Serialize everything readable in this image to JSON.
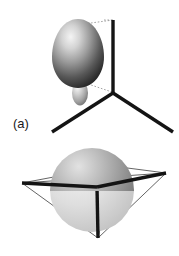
{
  "figure": {
    "background_color": "#ffffff",
    "width": 179,
    "height": 256
  },
  "panels": [
    {
      "id": "a",
      "label": "(a)",
      "label_position": {
        "x": 13,
        "y": 117
      },
      "axes": {
        "name": "three-bond-axis-frame",
        "vertex": {
          "x": 113,
          "y": 93
        },
        "color": "#141414",
        "stroke_width": 3.4,
        "arms": [
          {
            "name": "axis-up",
            "x2": 113,
            "y2": 20
          },
          {
            "name": "axis-lower-left",
            "x2": 52,
            "y2": 131
          },
          {
            "name": "axis-lower-right",
            "x2": 172,
            "y2": 131
          }
        ]
      },
      "orbital": {
        "name": "major-lobe",
        "shape": "teardrop",
        "center": {
          "x": 78,
          "y": 55
        },
        "rx": 26,
        "ry": 36,
        "fill_light": "#efefef",
        "fill_mid": "#8d8d8d",
        "fill_dark": "#2d2d2d",
        "highlight": {
          "x": 66,
          "y": 42
        }
      },
      "minor_orbital": {
        "name": "minor-lobe",
        "shape": "ellipse",
        "center": {
          "x": 80,
          "y": 93
        },
        "rx": 8,
        "ry": 12,
        "fill_light": "#f2f2f2",
        "fill_mid": "#a8a8a8",
        "fill_dark": "#616161"
      },
      "guides": {
        "name": "dotted-projection-lines",
        "color": "#9a9a9a",
        "stroke_width": 0.9,
        "dash": "1.6 1.8",
        "lines": [
          {
            "x1": 92,
            "y1": 22,
            "x2": 113,
            "y2": 20
          },
          {
            "x1": 87,
            "y1": 84,
            "x2": 113,
            "y2": 93
          }
        ]
      }
    },
    {
      "id": "b",
      "label": "(b)",
      "label_position": {
        "x": 13,
        "y": 222
      },
      "axes": {
        "name": "three-bond-axis-frame",
        "vertex": {
          "x": 97,
          "y": 187
        },
        "color": "#141414",
        "stroke_width": 3.4,
        "arms": [
          {
            "name": "axis-left",
            "x2": 22,
            "y2": 183
          },
          {
            "name": "axis-right",
            "x2": 166,
            "y2": 173
          },
          {
            "name": "axis-down",
            "x2": 98,
            "y2": 238
          }
        ]
      },
      "frame": {
        "name": "thin-tetrahedron-outline",
        "color": "#3c3c3c",
        "stroke_width": 0.8,
        "vertices": [
          {
            "name": "vertex-left",
            "x": 22,
            "y": 183
          },
          {
            "name": "vertex-right",
            "x": 166,
            "y": 173
          },
          {
            "name": "vertex-bottom",
            "x": 98,
            "y": 238
          },
          {
            "name": "vertex-back",
            "x": 112,
            "y": 166
          }
        ]
      },
      "sphere": {
        "name": "spherical-orbital",
        "center": {
          "x": 92,
          "y": 190
        },
        "radius": 42,
        "upper_fill_light": "#d8d8d8",
        "upper_fill_mid": "#9b9b9b",
        "upper_fill_dark": "#6b6b6b",
        "lower_fill_light": "#e4e4e4",
        "lower_fill_mid": "#c9c9c9",
        "highlight": {
          "x": 76,
          "y": 172
        }
      }
    }
  ]
}
